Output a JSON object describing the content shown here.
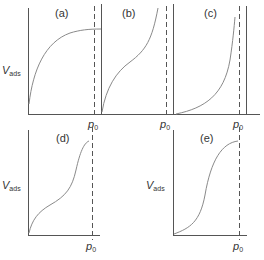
{
  "figure": {
    "y_axis_label": {
      "main": "V",
      "sub": "ads"
    },
    "x_marker_label": {
      "main": "p",
      "sub": "0"
    },
    "panels": [
      {
        "id": "a",
        "label": "(a)",
        "shape": "concave, saturating plateau (Type I)"
      },
      {
        "id": "b",
        "label": "(b)",
        "shape": "sigmoidal with inflection, rising steeply near p0 (Type II)"
      },
      {
        "id": "c",
        "label": "(c)",
        "shape": "convex, rising steeply near p0 (Type III)"
      },
      {
        "id": "d",
        "label": "(d)",
        "shape": "two-step with plateau near p0 (Type IV)"
      },
      {
        "id": "e",
        "label": "(e)",
        "shape": "sigmoidal with plateau near p0 (Type V)"
      }
    ]
  }
}
